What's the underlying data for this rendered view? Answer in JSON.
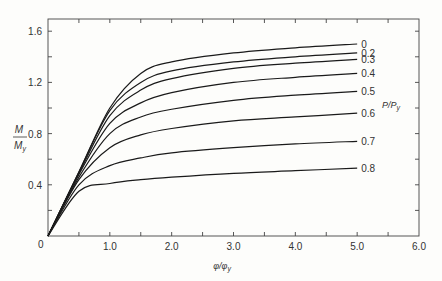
{
  "chart_data": {
    "type": "line",
    "title": "",
    "xlabel": "φ/φy",
    "ylabel": "M/My",
    "legend_title": "P/Py",
    "xlim": [
      0,
      6.0
    ],
    "ylim": [
      0,
      1.65
    ],
    "x_ticks": [
      "0",
      "1.0",
      "2.0",
      "3.0",
      "4.0",
      "5.0",
      "6.0"
    ],
    "y_ticks": [
      "0.4",
      "0.8",
      "1.2",
      "1.6"
    ],
    "origin_label": "0",
    "grid": false,
    "series": [
      {
        "name": "0",
        "x": [
          0,
          0.5,
          1.0,
          1.5,
          2.0,
          3.0,
          4.0,
          5.0
        ],
        "values": [
          0,
          0.5,
          1.0,
          1.27,
          1.36,
          1.43,
          1.47,
          1.5
        ]
      },
      {
        "name": "0.2",
        "x": [
          0,
          0.5,
          1.0,
          1.5,
          2.0,
          3.0,
          4.0,
          5.0
        ],
        "values": [
          0,
          0.5,
          0.98,
          1.2,
          1.29,
          1.36,
          1.4,
          1.43
        ]
      },
      {
        "name": "0.3",
        "x": [
          0,
          0.5,
          1.0,
          1.5,
          2.0,
          3.0,
          4.0,
          5.0
        ],
        "values": [
          0,
          0.49,
          0.94,
          1.14,
          1.23,
          1.31,
          1.35,
          1.38
        ]
      },
      {
        "name": "0.4",
        "x": [
          0,
          0.5,
          1.0,
          1.5,
          2.0,
          3.0,
          4.0,
          5.0
        ],
        "values": [
          0,
          0.48,
          0.88,
          1.04,
          1.12,
          1.2,
          1.24,
          1.27
        ]
      },
      {
        "name": "0.5",
        "x": [
          0,
          0.5,
          1.0,
          1.5,
          2.0,
          3.0,
          4.0,
          5.0
        ],
        "values": [
          0,
          0.46,
          0.8,
          0.93,
          0.99,
          1.06,
          1.1,
          1.13
        ]
      },
      {
        "name": "0.6",
        "x": [
          0,
          0.5,
          1.0,
          1.5,
          2.0,
          3.0,
          4.0,
          5.0
        ],
        "values": [
          0,
          0.44,
          0.69,
          0.79,
          0.84,
          0.9,
          0.93,
          0.96
        ]
      },
      {
        "name": "0.7",
        "x": [
          0,
          0.5,
          1.0,
          1.5,
          2.0,
          3.0,
          4.0,
          5.0
        ],
        "values": [
          0,
          0.4,
          0.55,
          0.61,
          0.65,
          0.69,
          0.72,
          0.74
        ]
      },
      {
        "name": "0.8",
        "x": [
          0,
          0.5,
          1.0,
          1.5,
          2.0,
          3.0,
          4.0,
          5.0
        ],
        "values": [
          0,
          0.35,
          0.41,
          0.44,
          0.46,
          0.49,
          0.51,
          0.53
        ]
      }
    ]
  }
}
